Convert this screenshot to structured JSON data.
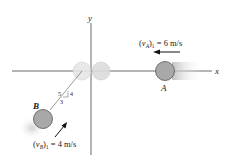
{
  "diagram": {
    "axes": {
      "x_label": "x",
      "y_label": "y"
    },
    "particle_a": {
      "label": "A",
      "velocity_label": "(v_A)_1 = 6 m/s",
      "v_sym": "v",
      "v_sub": "A",
      "v_rest": " = 6 m/s",
      "v_idx": "1"
    },
    "particle_b": {
      "label": "B",
      "velocity_label": "(v_B)_1 = 4 m/s",
      "v_sym": "v",
      "v_sub": "B",
      "v_rest": " = 4 m/s",
      "v_idx": "1"
    },
    "slope_triangle": {
      "hyp": "5",
      "rise": "4",
      "run": "3"
    },
    "colors": {
      "ball": "#a8a8a8",
      "ball_stroke": "#555555",
      "ghost": "#e4e4e4",
      "axis": "#444444"
    }
  }
}
